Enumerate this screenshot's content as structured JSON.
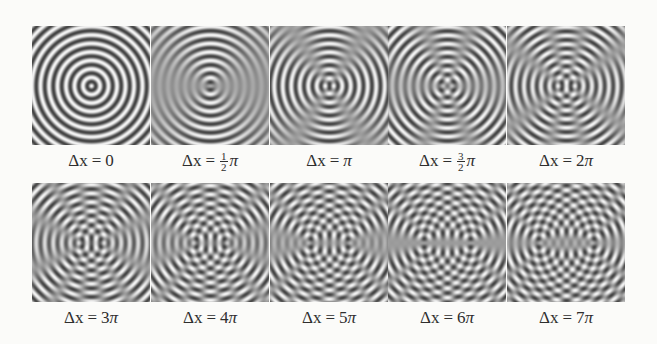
{
  "figure": {
    "style": {
      "background": "#fbfbf9",
      "dark_band": "#454545",
      "light_band": "#f2f2f2",
      "mid_gray": "#9c9c9c",
      "label_color": "#2e2e2e"
    },
    "wavelength_px": 8.5,
    "px_per_pi": 7.8,
    "rows": [
      {
        "panels": [
          {
            "label": {
              "lhs": "Δx",
              "var": "x",
              "eq": "=",
              "coef": "0",
              "frac": null,
              "pi": ""
            },
            "phase_pi": 0
          },
          {
            "label": {
              "lhs": "Δx",
              "var": "x",
              "eq": "=",
              "coef": "",
              "frac": {
                "num": "1",
                "den": "2"
              },
              "pi": "π"
            },
            "phase_pi": 0.5
          },
          {
            "label": {
              "lhs": "Δx",
              "var": "x",
              "eq": "=",
              "coef": "",
              "frac": null,
              "pi": "π"
            },
            "phase_pi": 1
          },
          {
            "label": {
              "lhs": "Δx",
              "var": "x",
              "eq": "=",
              "coef": "",
              "frac": {
                "num": "3",
                "den": "2"
              },
              "pi": "π"
            },
            "phase_pi": 1.5
          },
          {
            "label": {
              "lhs": "Δx",
              "var": "x",
              "eq": "=",
              "coef": "2",
              "frac": null,
              "pi": "π"
            },
            "phase_pi": 2
          }
        ]
      },
      {
        "panels": [
          {
            "label": {
              "lhs": "Δx",
              "var": "x",
              "eq": "=",
              "coef": "3",
              "frac": null,
              "pi": "π"
            },
            "phase_pi": 3
          },
          {
            "label": {
              "lhs": "Δx",
              "var": "x",
              "eq": "=",
              "coef": "4",
              "frac": null,
              "pi": "π"
            },
            "phase_pi": 4
          },
          {
            "label": {
              "lhs": "Δx",
              "var": "x",
              "eq": "=",
              "coef": "5",
              "frac": null,
              "pi": "π"
            },
            "phase_pi": 5
          },
          {
            "label": {
              "lhs": "Δx",
              "var": "x",
              "eq": "=",
              "coef": "6",
              "frac": null,
              "pi": "π"
            },
            "phase_pi": 6
          },
          {
            "label": {
              "lhs": "Δx",
              "var": "x",
              "eq": "=",
              "coef": "7",
              "frac": null,
              "pi": "π"
            },
            "phase_pi": 7
          }
        ]
      }
    ]
  }
}
